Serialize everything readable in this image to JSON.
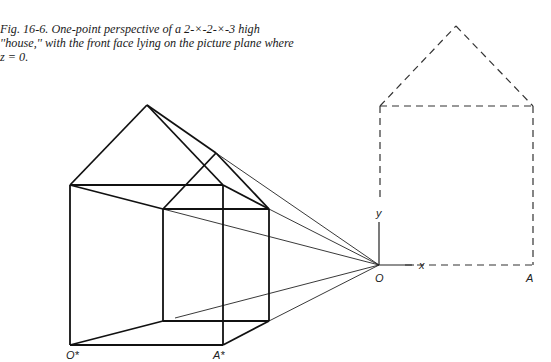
{
  "caption": "Fig. 16-6. One-point perspective of a 2-×-2-×-3 high ''house,'' with the front face lying on the picture plane where z = 0.",
  "labels": {
    "origin": "O",
    "x_axis": "x",
    "y_axis": "y",
    "point_a": "A",
    "origin_star": "O*",
    "point_a_star": "A*"
  },
  "colors": {
    "line": "#1a1a1a",
    "background": "#ffffff"
  }
}
